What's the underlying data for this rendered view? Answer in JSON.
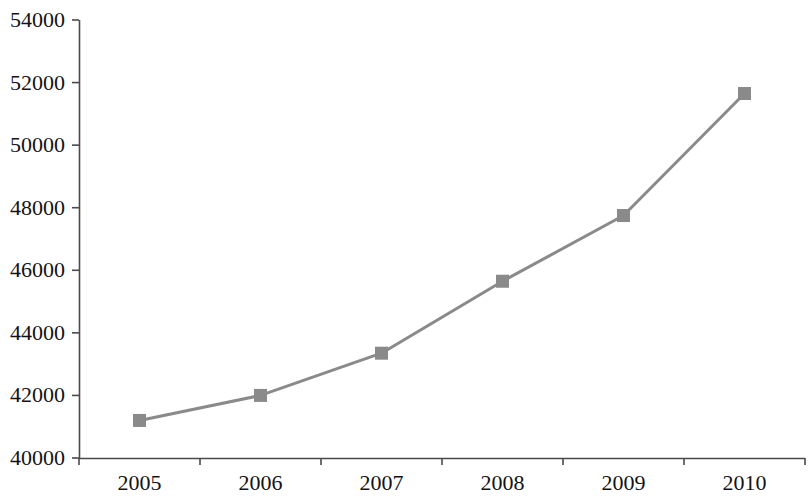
{
  "chart_data": {
    "type": "line",
    "title": "",
    "subtitle": "",
    "xlabel": "",
    "ylabel": "",
    "categories": [
      "2005",
      "2006",
      "2007",
      "2008",
      "2009",
      "2010"
    ],
    "x": [
      2005,
      2006,
      2007,
      2008,
      2009,
      2010
    ],
    "values": [
      41200,
      42000,
      43350,
      45650,
      47750,
      51650
    ],
    "series": [
      {
        "name": "",
        "values": [
          41200,
          42000,
          43350,
          45650,
          47750,
          51650
        ]
      }
    ],
    "ylim": [
      40000,
      54000
    ],
    "y_ticks": [
      40000,
      42000,
      44000,
      46000,
      48000,
      50000,
      52000,
      54000
    ],
    "y_tick_labels": [
      "40000",
      "42000",
      "44000",
      "46000",
      "48000",
      "50000",
      "52000",
      "54000"
    ],
    "x_tick_labels": [
      "2005",
      "2006",
      "2007",
      "2008",
      "2009",
      "2010"
    ],
    "grid": false,
    "legend": false,
    "legend_position": "none",
    "annotations": [],
    "colors": {
      "line": "#8a8a8a",
      "marker": "#8a8a8a",
      "axis": "#4a4a4a",
      "text": "#131313",
      "background": "#ffffff"
    },
    "marker_shape": "square",
    "line_width": 3
  },
  "axes": {
    "plot_left": 79,
    "plot_right": 805,
    "plot_top": 20,
    "plot_bottom": 458
  }
}
